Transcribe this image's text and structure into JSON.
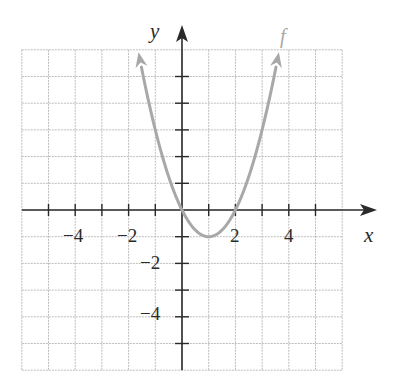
{
  "chart_data": {
    "type": "line",
    "title": "",
    "xlabel": "x",
    "ylabel": "y",
    "xlim": [
      -6,
      6
    ],
    "ylim": [
      -6,
      6
    ],
    "grid": true,
    "grid_step": 1,
    "x_ticks": [
      -4,
      -2,
      2,
      4
    ],
    "y_ticks": [
      -2,
      -4
    ],
    "x_tick_labels": [
      "−4",
      "−2",
      "2",
      "4"
    ],
    "y_tick_labels": [
      "−2",
      "−4"
    ],
    "series": [
      {
        "name": "f",
        "equation": "f(x) = x^2 - 2x",
        "color": "#a8a8a8",
        "x": [
          -1.6,
          -1.0,
          0,
          0.5,
          1,
          1.5,
          2,
          3,
          3.6
        ],
        "y": [
          5.76,
          3,
          0,
          -0.75,
          -1,
          -0.75,
          0,
          3,
          5.76
        ],
        "vertex": [
          1,
          -1
        ],
        "x_intercepts": [
          0,
          2
        ],
        "arrows_both_ends": true
      }
    ],
    "annotations": [
      {
        "text": "f",
        "position": "near top of right branch"
      }
    ]
  },
  "labels": {
    "x_axis": "x",
    "y_axis": "y",
    "curve": "f",
    "xt_m4": "−4",
    "xt_m2": "−2",
    "xt_2": "2",
    "xt_4": "4",
    "yt_m2": "−2",
    "yt_m4": "−4"
  },
  "colors": {
    "grid": "#bdbdbd",
    "axis": "#2a2a2a",
    "curve": "#a8a8a8"
  }
}
